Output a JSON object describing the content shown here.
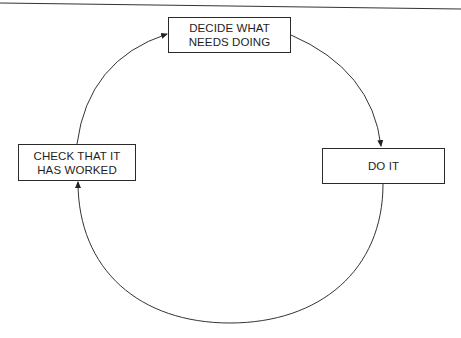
{
  "diagram": {
    "type": "cycle",
    "stroke_color": "#2a2a2a",
    "nodes": [
      {
        "id": "decide",
        "lines": [
          "DECIDE WHAT",
          "NEEDS DOING"
        ]
      },
      {
        "id": "do",
        "lines": [
          "DO IT"
        ]
      },
      {
        "id": "check",
        "lines": [
          "CHECK THAT IT",
          "HAS WORKED"
        ]
      }
    ],
    "edges": [
      {
        "from": "decide",
        "to": "do"
      },
      {
        "from": "do",
        "to": "check"
      },
      {
        "from": "check",
        "to": "decide"
      }
    ]
  }
}
